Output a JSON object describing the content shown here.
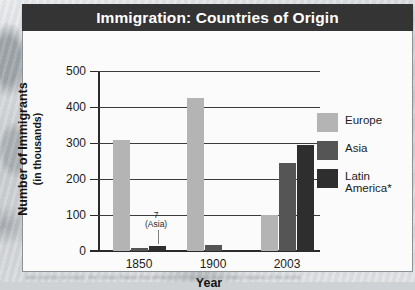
{
  "figure": {
    "title": "Immigration: Countries of Origin",
    "caption_blurred": "and country of origin, the United States has attracted immigrants from many regions of the world"
  },
  "colors": {
    "title_bar": "#343434",
    "panel": "#fbfbfb",
    "europe": "#b4b4b4",
    "asia": "#555555",
    "latin_america": "#2e2e2e",
    "axis": "#2a2a2a"
  },
  "chart_data": {
    "type": "bar",
    "title": "Immigration: Countries of Origin",
    "xlabel": "Year",
    "ylabel": "Number of Immigrants",
    "ylabel_sub": "(in thousands)",
    "categories": [
      "1850",
      "1900",
      "2003"
    ],
    "ylim": [
      0,
      500
    ],
    "yticks": [
      0,
      100,
      200,
      300,
      400,
      500
    ],
    "grid": true,
    "legend_position": "right",
    "series": [
      {
        "name": "Europe",
        "color": "#b4b4b4",
        "values": [
          308,
          425,
          100
        ]
      },
      {
        "name": "Asia",
        "color": "#555555",
        "values": [
          7,
          17,
          245
        ]
      },
      {
        "name": "Latin America*",
        "color": "#2e2e2e",
        "values": [
          14,
          4,
          295
        ]
      }
    ],
    "annotations": [
      {
        "text_value": "7",
        "text_note": "(Asia)",
        "series": "Asia",
        "category": "1850",
        "value": 7
      }
    ]
  },
  "legend": {
    "items": [
      {
        "label": "Europe"
      },
      {
        "label": "Asia"
      },
      {
        "label": "Latin\nAmerica*"
      }
    ]
  }
}
